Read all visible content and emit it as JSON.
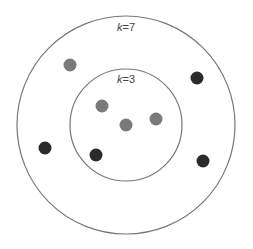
{
  "diagram": {
    "circles": [
      {
        "id": "outer",
        "label_k": "k",
        "label_eq": "=7",
        "cx": 126,
        "cy": 125,
        "r": 109,
        "label_x": 126,
        "label_y": 31
      },
      {
        "id": "inner",
        "label_k": "k",
        "label_eq": "=3",
        "cx": 126,
        "cy": 125,
        "r": 56,
        "label_x": 126,
        "label_y": 83
      }
    ],
    "points": [
      {
        "x": 70,
        "y": 65,
        "class": "gray"
      },
      {
        "x": 197,
        "y": 78,
        "class": "dark"
      },
      {
        "x": 102,
        "y": 106,
        "class": "gray"
      },
      {
        "x": 126,
        "y": 125,
        "class": "query"
      },
      {
        "x": 156,
        "y": 119,
        "class": "gray"
      },
      {
        "x": 45,
        "y": 148,
        "class": "dark"
      },
      {
        "x": 96,
        "y": 155,
        "class": "dark"
      },
      {
        "x": 203,
        "y": 161,
        "class": "dark"
      }
    ],
    "colors": {
      "gray": "#7a7a7a",
      "dark": "#2b2b2b",
      "query": "#7a7a7a",
      "stroke": "#777777"
    }
  }
}
